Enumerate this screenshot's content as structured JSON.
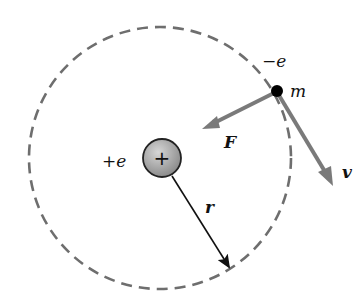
{
  "diagram": {
    "labels": {
      "electron_charge": "−e",
      "electron_mass": "m",
      "force": "F",
      "velocity": "v",
      "nucleus_charge": "+e",
      "radius": "r",
      "nucleus_symbol": "+"
    },
    "colors": {
      "orbit": "#6e6e6e",
      "vector_arrows": "#7a7a7a",
      "radius_arrow": "#111111",
      "nucleus_fill": "#a8a8a8",
      "electron": "#000000"
    }
  }
}
